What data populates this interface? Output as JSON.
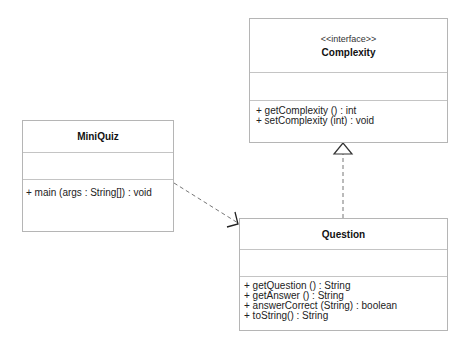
{
  "diagram": {
    "type": "uml-class-diagram",
    "classes": [
      {
        "id": "complexity",
        "stereotype": "<<interface>>",
        "name": "Complexity",
        "attributes": [],
        "operations": [
          "+ getComplexity () : int",
          "+ setComplexity (int) : void"
        ]
      },
      {
        "id": "miniquiz",
        "stereotype": "",
        "name": "MiniQuiz",
        "attributes": [],
        "operations": [
          "+ main (args : String[]) : void"
        ]
      },
      {
        "id": "question",
        "stereotype": "",
        "name": "Question",
        "attributes": [],
        "operations": [
          "+ getQuestion () : String",
          "+ getAnswer () : String",
          "+ answerCorrect (String) : boolean",
          "+ toString() : String"
        ]
      }
    ],
    "relationships": [
      {
        "type": "realization",
        "from": "Question",
        "to": "Complexity",
        "style": "dashed line, hollow triangle"
      },
      {
        "type": "dependency",
        "from": "MiniQuiz",
        "to": "Question",
        "style": "dashed line, open arrow"
      }
    ],
    "colors": {
      "border": "#b5b5b5",
      "divider": "#c4c4c4",
      "line": "#666666",
      "text": "#222222"
    }
  }
}
